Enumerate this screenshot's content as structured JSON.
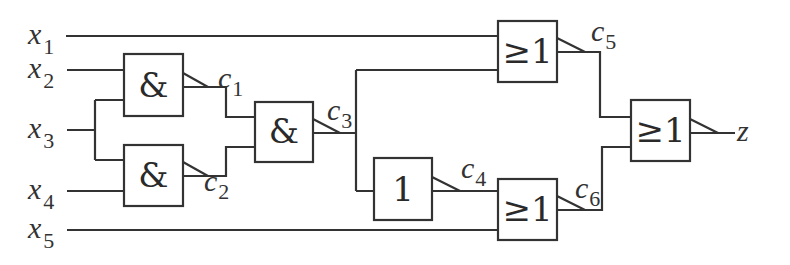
{
  "diagram": {
    "type": "logic-circuit",
    "inputs": [
      {
        "var": "x",
        "sub": "1"
      },
      {
        "var": "x",
        "sub": "2"
      },
      {
        "var": "x",
        "sub": "3"
      },
      {
        "var": "x",
        "sub": "4"
      },
      {
        "var": "x",
        "sub": "5"
      }
    ],
    "gates": [
      {
        "id": "and1",
        "symbol": "&",
        "inputs": [
          "x2",
          "x3"
        ],
        "output": {
          "var": "c",
          "sub": "1"
        }
      },
      {
        "id": "and2",
        "symbol": "&",
        "inputs": [
          "x3",
          "x4"
        ],
        "output": {
          "var": "c",
          "sub": "2"
        }
      },
      {
        "id": "and3",
        "symbol": "&",
        "inputs": [
          "c1",
          "c2"
        ],
        "output": {
          "var": "c",
          "sub": "3"
        }
      },
      {
        "id": "not1",
        "symbol": "1",
        "inputs": [
          "c3"
        ],
        "output": {
          "var": "c",
          "sub": "4"
        }
      },
      {
        "id": "or5",
        "symbol": "≥1",
        "inputs": [
          "x1",
          "c3"
        ],
        "output": {
          "var": "c",
          "sub": "5"
        }
      },
      {
        "id": "or6",
        "symbol": "≥1",
        "inputs": [
          "c4",
          "x5"
        ],
        "output": {
          "var": "c",
          "sub": "6"
        }
      },
      {
        "id": "or7",
        "symbol": "≥1",
        "inputs": [
          "c5",
          "c6"
        ],
        "output": {
          "var": "z",
          "sub": ""
        }
      }
    ],
    "output": "z"
  }
}
